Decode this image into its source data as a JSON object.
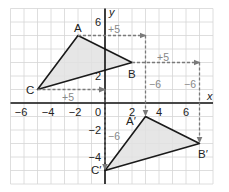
{
  "diagram": {
    "type": "coordinate-plane-translation",
    "grid": {
      "x_min": -7,
      "x_max": 8,
      "y_min": -6,
      "y_max": 7,
      "step": 1
    },
    "axes": {
      "x_label": "x",
      "y_label": "y",
      "x_ticks": [
        "−6",
        "−4",
        "−2",
        "0",
        "2",
        "4",
        "6"
      ],
      "x_tick_values": [
        -6,
        -4,
        -2,
        0,
        2,
        4,
        6
      ],
      "y_ticks": [
        "6",
        "2",
        "−2",
        "−4"
      ],
      "y_tick_values": [
        6,
        2,
        -2,
        -4
      ]
    },
    "preimage": {
      "vertices": [
        {
          "label": "A",
          "x": -2,
          "y": 5
        },
        {
          "label": "B",
          "x": 2,
          "y": 3
        },
        {
          "label": "C",
          "x": -5,
          "y": 1
        }
      ]
    },
    "image": {
      "vertices": [
        {
          "label": "A′",
          "x": 3,
          "y": -1
        },
        {
          "label": "B′",
          "x": 7,
          "y": -3
        },
        {
          "label": "C′",
          "x": 0,
          "y": -5
        }
      ]
    },
    "translation_labels": {
      "a_horizontal": "+5",
      "b_horizontal": "+5",
      "c_horizontal": "+5",
      "a_vertical": "−6",
      "b_vertical": "−6",
      "c_vertical": "−6"
    },
    "colors": {
      "grid": "#d4d4d4",
      "axis": "#111111",
      "triangle_stroke": "#1a1a1a",
      "triangle_fill": "#e2e2e2",
      "arrow": "#7a7a7a",
      "arrow_label": "#888888"
    }
  }
}
